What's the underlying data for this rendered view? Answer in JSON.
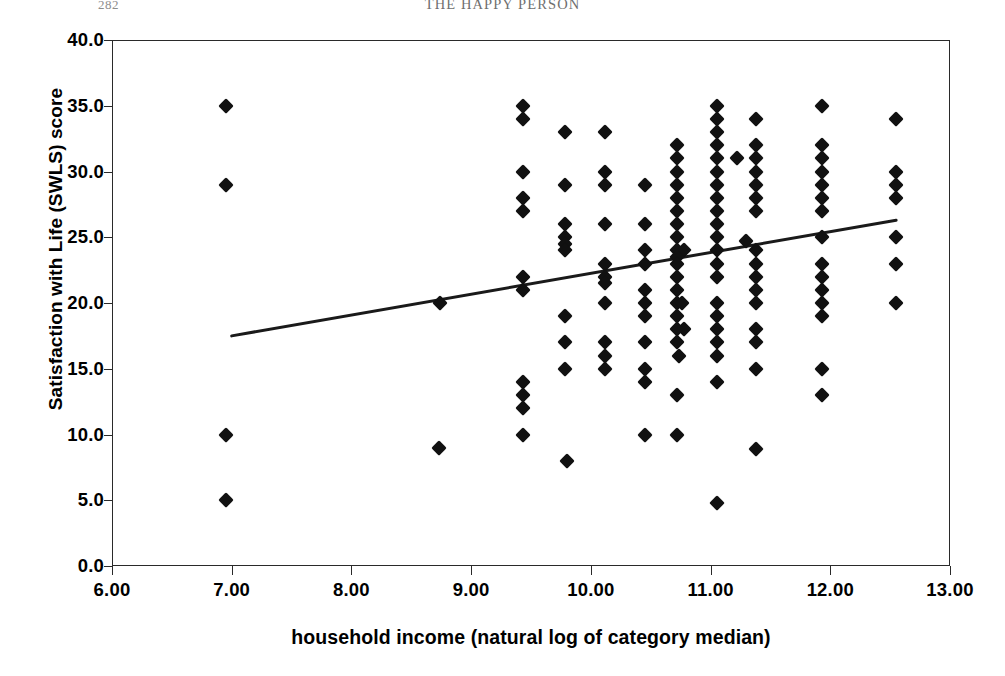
{
  "page_header": {
    "folio": "282",
    "running_title": "THE HAPPY PERSON"
  },
  "chart_data": {
    "type": "scatter",
    "title": "",
    "xlabel": "household income (natural log of category median)",
    "ylabel": "Satisfaction with Life (SWLS) score",
    "xlim": [
      6.0,
      13.0
    ],
    "ylim": [
      0.0,
      40.0
    ],
    "xticks": [
      6.0,
      7.0,
      8.0,
      9.0,
      10.0,
      11.0,
      12.0,
      13.0
    ],
    "xtick_labels": [
      "6.00",
      "7.00",
      "8.00",
      "9.00",
      "10.00",
      "11.00",
      "12.00",
      "13.00"
    ],
    "yticks": [
      0.0,
      5.0,
      10.0,
      15.0,
      20.0,
      25.0,
      30.0,
      35.0,
      40.0
    ],
    "ytick_labels": [
      "0.0",
      "5.0",
      "10.0",
      "15.0",
      "20.0",
      "25.0",
      "30.0",
      "35.0",
      "40.0"
    ],
    "grid": false,
    "legend": null,
    "marker": {
      "shape": "diamond",
      "color": "#111111",
      "size": 11
    },
    "trendline": {
      "type": "linear-fit",
      "color": "#1a1a1a",
      "width": 3,
      "x_start": 7.0,
      "y_start": 17.5,
      "x_end": 12.55,
      "y_end": 26.3
    },
    "points": [
      [
        6.95,
        35.0
      ],
      [
        6.95,
        29.0
      ],
      [
        6.95,
        10.0
      ],
      [
        6.95,
        5.0
      ],
      [
        8.74,
        20.0
      ],
      [
        8.73,
        9.0
      ],
      [
        9.43,
        35.0
      ],
      [
        9.43,
        34.0
      ],
      [
        9.43,
        30.0
      ],
      [
        9.43,
        28.0
      ],
      [
        9.43,
        27.0
      ],
      [
        9.43,
        22.0
      ],
      [
        9.43,
        21.0
      ],
      [
        9.43,
        14.0
      ],
      [
        9.43,
        13.0
      ],
      [
        9.43,
        12.0
      ],
      [
        9.43,
        10.0
      ],
      [
        9.78,
        33.0
      ],
      [
        9.78,
        29.0
      ],
      [
        9.78,
        26.0
      ],
      [
        9.78,
        25.0
      ],
      [
        9.78,
        24.5
      ],
      [
        9.78,
        24.0
      ],
      [
        9.78,
        19.0
      ],
      [
        9.78,
        17.0
      ],
      [
        9.78,
        15.0
      ],
      [
        9.8,
        8.0
      ],
      [
        10.12,
        33.0
      ],
      [
        10.12,
        30.0
      ],
      [
        10.12,
        29.0
      ],
      [
        10.12,
        26.0
      ],
      [
        10.12,
        23.0
      ],
      [
        10.12,
        22.0
      ],
      [
        10.12,
        21.5
      ],
      [
        10.12,
        20.0
      ],
      [
        10.12,
        17.0
      ],
      [
        10.12,
        16.0
      ],
      [
        10.12,
        15.0
      ],
      [
        10.45,
        29.0
      ],
      [
        10.45,
        26.0
      ],
      [
        10.45,
        24.0
      ],
      [
        10.45,
        23.0
      ],
      [
        10.45,
        21.0
      ],
      [
        10.45,
        20.0
      ],
      [
        10.45,
        19.0
      ],
      [
        10.45,
        17.0
      ],
      [
        10.45,
        15.0
      ],
      [
        10.45,
        14.0
      ],
      [
        10.45,
        10.0
      ],
      [
        10.72,
        32.0
      ],
      [
        10.72,
        31.0
      ],
      [
        10.72,
        30.0
      ],
      [
        10.72,
        29.0
      ],
      [
        10.72,
        28.0
      ],
      [
        10.72,
        27.0
      ],
      [
        10.72,
        26.0
      ],
      [
        10.72,
        25.0
      ],
      [
        10.72,
        24.0
      ],
      [
        10.78,
        24.0
      ],
      [
        10.72,
        23.5
      ],
      [
        10.72,
        23.0
      ],
      [
        10.72,
        22.0
      ],
      [
        10.72,
        21.0
      ],
      [
        10.72,
        20.0
      ],
      [
        10.76,
        20.0
      ],
      [
        10.72,
        19.0
      ],
      [
        10.78,
        18.0
      ],
      [
        10.72,
        18.0
      ],
      [
        10.72,
        17.0
      ],
      [
        10.74,
        16.0
      ],
      [
        10.72,
        13.0
      ],
      [
        10.72,
        10.0
      ],
      [
        11.05,
        35.0
      ],
      [
        11.05,
        34.0
      ],
      [
        11.05,
        33.0
      ],
      [
        11.05,
        32.0
      ],
      [
        11.05,
        31.0
      ],
      [
        11.05,
        30.0
      ],
      [
        11.05,
        29.0
      ],
      [
        11.05,
        28.0
      ],
      [
        11.05,
        27.0
      ],
      [
        11.05,
        26.0
      ],
      [
        11.05,
        25.0
      ],
      [
        11.05,
        24.0
      ],
      [
        11.05,
        23.0
      ],
      [
        11.05,
        22.0
      ],
      [
        11.05,
        20.0
      ],
      [
        11.05,
        19.0
      ],
      [
        11.05,
        18.0
      ],
      [
        11.05,
        17.0
      ],
      [
        11.05,
        16.0
      ],
      [
        11.05,
        14.0
      ],
      [
        11.05,
        4.8
      ],
      [
        11.38,
        34.0
      ],
      [
        11.38,
        32.0
      ],
      [
        11.38,
        31.0
      ],
      [
        11.38,
        30.0
      ],
      [
        11.38,
        29.0
      ],
      [
        11.38,
        28.0
      ],
      [
        11.38,
        27.0
      ],
      [
        11.38,
        24.0
      ],
      [
        11.38,
        23.0
      ],
      [
        11.38,
        22.0
      ],
      [
        11.38,
        21.0
      ],
      [
        11.38,
        20.0
      ],
      [
        11.38,
        18.0
      ],
      [
        11.38,
        17.0
      ],
      [
        11.38,
        15.0
      ],
      [
        11.38,
        8.9
      ],
      [
        11.22,
        31.0
      ],
      [
        11.3,
        24.7
      ],
      [
        11.93,
        35.0
      ],
      [
        11.93,
        32.0
      ],
      [
        11.93,
        31.0
      ],
      [
        11.93,
        30.0
      ],
      [
        11.93,
        29.0
      ],
      [
        11.93,
        28.0
      ],
      [
        11.93,
        27.0
      ],
      [
        11.93,
        25.0
      ],
      [
        11.93,
        23.0
      ],
      [
        11.93,
        22.0
      ],
      [
        11.93,
        21.0
      ],
      [
        11.93,
        20.0
      ],
      [
        11.93,
        19.0
      ],
      [
        11.93,
        15.0
      ],
      [
        11.93,
        13.0
      ],
      [
        12.55,
        34.0
      ],
      [
        12.55,
        30.0
      ],
      [
        12.55,
        29.0
      ],
      [
        12.55,
        28.0
      ],
      [
        12.55,
        25.0
      ],
      [
        12.55,
        23.0
      ],
      [
        12.55,
        20.0
      ]
    ]
  }
}
